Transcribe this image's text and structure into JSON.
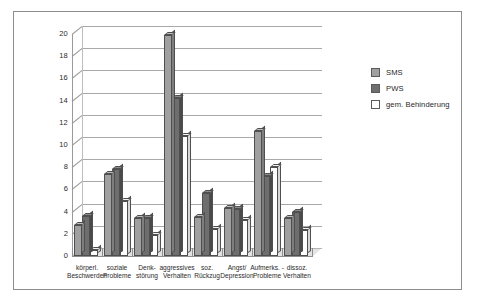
{
  "chart_data": {
    "type": "bar",
    "title": "",
    "xlabel": "",
    "ylabel": "",
    "ylim": [
      0,
      20
    ],
    "ytick_step": 2,
    "yticks": [
      "20",
      "18",
      "16",
      "14",
      "12",
      "10",
      "8",
      "6",
      "4",
      "2",
      "0"
    ],
    "grid": true,
    "legend_position": "right",
    "categories": [
      "körperl. Beschwerden",
      "soziale Probleme",
      "Denk- störung",
      "aggressives Verhalten",
      "soz. Rückzug",
      "Angst/ Depression",
      "Aufmerks.- Probleme",
      "dissoz. Verhalten"
    ],
    "category_lines": [
      [
        "körperl.",
        "Beschwerden"
      ],
      [
        "soziale",
        "Probleme"
      ],
      [
        "Denk-",
        "störung"
      ],
      [
        "aggressives",
        "Verhalten"
      ],
      [
        "soz.",
        "Rückzug"
      ],
      [
        "Angst/",
        "Depression"
      ],
      [
        "Aufmerks. -",
        "Probleme"
      ],
      [
        "dissoz.",
        "Verhalten"
      ]
    ],
    "series": [
      {
        "name": "SMS",
        "color": "#a0a0a0",
        "values": [
          2.8,
          7.4,
          3.4,
          19.9,
          3.5,
          4.3,
          11.3,
          3.4
        ]
      },
      {
        "name": "PWS",
        "color": "#6e6e6e",
        "values": [
          3.6,
          7.8,
          3.4,
          14.2,
          5.7,
          4.2,
          7.2,
          4.0
        ]
      },
      {
        "name": "gem. Behinderung",
        "color": "#ffffff",
        "values": [
          0.5,
          5.0,
          1.9,
          10.8,
          2.4,
          3.2,
          8.0,
          2.3
        ]
      }
    ]
  },
  "legend": {
    "items": [
      {
        "label": "SMS"
      },
      {
        "label": "PWS"
      },
      {
        "label": "gem. Behinderung"
      }
    ]
  }
}
